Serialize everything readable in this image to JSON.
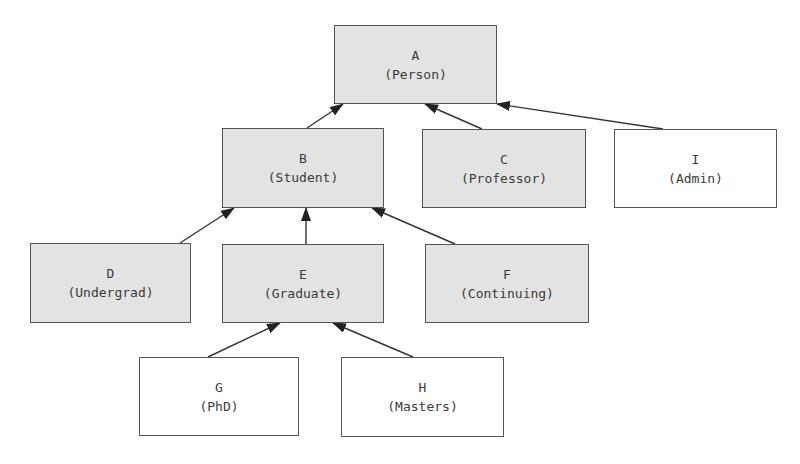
{
  "diagram": {
    "type": "class-hierarchy",
    "colors": {
      "shaded_fill": "#e3e3e3",
      "plain_fill": "#ffffff",
      "border": "#555555",
      "edge": "#333333",
      "text": "#3a3a3a"
    },
    "nodes": [
      {
        "id": "A",
        "letter": "A",
        "label": "(Person)",
        "shaded": true,
        "x": 334,
        "y": 25,
        "w": 163,
        "h": 79
      },
      {
        "id": "B",
        "letter": "B",
        "label": "(Student)",
        "shaded": true,
        "x": 222,
        "y": 128,
        "w": 162,
        "h": 80
      },
      {
        "id": "C",
        "letter": "C",
        "label": "(Professor)",
        "shaded": true,
        "x": 422,
        "y": 129,
        "w": 164,
        "h": 79
      },
      {
        "id": "I",
        "letter": "I",
        "label": "(Admin)",
        "shaded": false,
        "x": 614,
        "y": 129,
        "w": 163,
        "h": 79
      },
      {
        "id": "D",
        "letter": "D",
        "label": "(Undergrad)",
        "shaded": true,
        "x": 30,
        "y": 243,
        "w": 161,
        "h": 80
      },
      {
        "id": "E",
        "letter": "E",
        "label": "(Graduate)",
        "shaded": true,
        "x": 222,
        "y": 244,
        "w": 162,
        "h": 79
      },
      {
        "id": "F",
        "letter": "F",
        "label": "(Continuing)",
        "shaded": true,
        "x": 425,
        "y": 244,
        "w": 164,
        "h": 79
      },
      {
        "id": "G",
        "letter": "G",
        "label": "(PhD)",
        "shaded": false,
        "x": 139,
        "y": 357,
        "w": 160,
        "h": 79
      },
      {
        "id": "H",
        "letter": "H",
        "label": "(Masters)",
        "shaded": false,
        "x": 341,
        "y": 357,
        "w": 163,
        "h": 80
      }
    ],
    "edges": [
      {
        "from": "B",
        "to": "A",
        "x1": 307,
        "y1": 128,
        "x2": 343,
        "y2": 104
      },
      {
        "from": "C",
        "to": "A",
        "x1": 482,
        "y1": 129,
        "x2": 425,
        "y2": 104
      },
      {
        "from": "I",
        "to": "A",
        "x1": 663,
        "y1": 129,
        "x2": 497,
        "y2": 104
      },
      {
        "from": "D",
        "to": "B",
        "x1": 180,
        "y1": 243,
        "x2": 234,
        "y2": 208
      },
      {
        "from": "E",
        "to": "B",
        "x1": 306,
        "y1": 244,
        "x2": 306,
        "y2": 208
      },
      {
        "from": "F",
        "to": "B",
        "x1": 455,
        "y1": 244,
        "x2": 372,
        "y2": 208
      },
      {
        "from": "G",
        "to": "E",
        "x1": 208,
        "y1": 357,
        "x2": 280,
        "y2": 323
      },
      {
        "from": "H",
        "to": "E",
        "x1": 413,
        "y1": 357,
        "x2": 333,
        "y2": 323
      }
    ]
  }
}
